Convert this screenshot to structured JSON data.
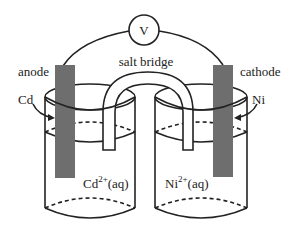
{
  "diagram": {
    "type": "galvanic-cell",
    "voltmeter": {
      "label": "V"
    },
    "salt_bridge": {
      "label": "salt bridge"
    },
    "left_half_cell": {
      "electrode_role": "anode",
      "electrode_metal": "Cd",
      "solution_ion": "Cd",
      "solution_charge": "2+",
      "solution_state": "(aq)"
    },
    "right_half_cell": {
      "electrode_role": "cathode",
      "electrode_metal": "Ni",
      "solution_ion": "Ni",
      "solution_charge": "2+",
      "solution_state": "(aq)"
    },
    "colors": {
      "line": "#222222",
      "electrode": "#6e6e6e",
      "background": "#ffffff"
    }
  }
}
